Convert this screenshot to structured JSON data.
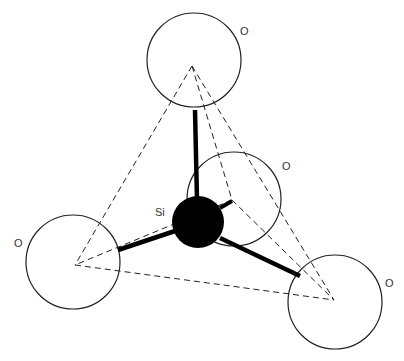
{
  "diagram": {
    "title": "",
    "labels": {
      "si": "Si",
      "o_top": "O",
      "o_back": "O",
      "o_left": "O",
      "o_right": "O"
    },
    "colors": {
      "line": "#222222",
      "silicon": "#000000",
      "background": "#ffffff"
    }
  }
}
